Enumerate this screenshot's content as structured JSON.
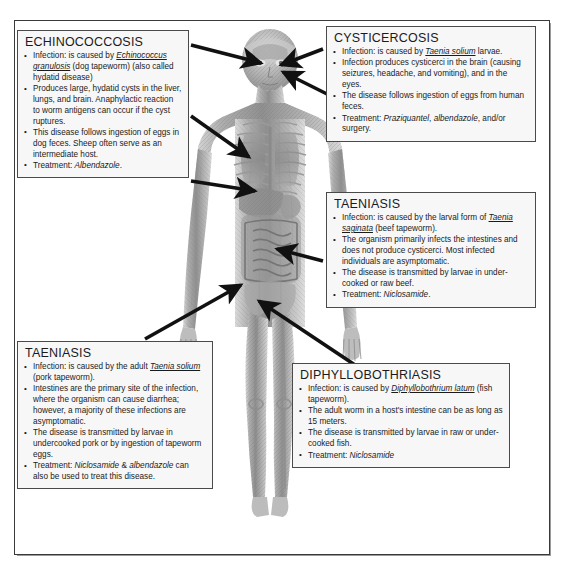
{
  "figure": {
    "colors": {
      "frame_border": "#3a3a3a",
      "box_border": "#4a4a4a",
      "box_fill": "#f7f7f7",
      "arrow": "#111111",
      "text": "#1b1b1b",
      "page_background": "#ffffff"
    }
  },
  "callouts": [
    {
      "id": "echinococcosis",
      "title": "ECHINOCOCCOSIS",
      "bullets": [
        "Infection: is caused by <u><i>Echinococcus granulosis</i></u> (dog tapeworm) (also called hydatid disease)",
        "Produces large, hydatid cysts in the liver, lungs, and brain. Anaphylactic reaction to worm antigens can occur if the cyst ruptures.",
        "This disease follows ingestion of eggs in dog feces. Sheep often serve as an intermediate host.",
        "Treatment: <i>Albendazole</i>."
      ]
    },
    {
      "id": "cysticercosis",
      "title": "CYSTICERCOSIS",
      "bullets": [
        "Infection: is caused by <u><i>Taenia solium</i></u> larvae.",
        "Infection produces cysticerci in the brain (causing seizures, headache, and vomiting), and in the eyes.",
        "The disease follows ingestion of eggs from human feces.",
        "Treatment: <i>Praziquantel</i>, <i>albendazole</i>, and/or surgery."
      ]
    },
    {
      "id": "taeniasis-right",
      "title": "TAENIASIS",
      "bullets": [
        "Infection: is caused by the larval form of <u><i>Taenia saginata</i></u> (beef tapeworm).",
        "The organism primarily infects the intestines and does not produce cysticerci. Most infected individuals are asymptomatic.",
        "The disease is transmitted by larvae in under-cooked or raw beef.",
        "Treatment: <i>Niclosamide</i>."
      ]
    },
    {
      "id": "taeniasis-left",
      "title": "TAENIASIS",
      "bullets": [
        "Infection: is caused by the adult <u><i>Taenia solium</i></u> (pork tapeworm).",
        "Intestines are the primary site of the infection, where the organism can cause diarrhea; however, a majority of these infections are asymptomatic.",
        "The disease is transmitted by larvae in undercooked pork or by ingestion of tapeworm eggs.",
        "Treatment: <i>Niclosamide</i> &amp; <i>albendazole</i> can also be used to treat this disease."
      ]
    },
    {
      "id": "diphyllobothriasis",
      "title": "DIPHYLLOBOTHRIASIS",
      "bullets": [
        "Infection: is caused by <u><i>Diphyllobothrium latum</i></u> (fish tapeworm).",
        "The adult worm in a host's intestine can be as long as 15 meters.",
        "The disease is transmitted by larvae in raw or under-cooked fish.",
        "Treatment: <i>Niclosamide</i>"
      ]
    }
  ],
  "arrows": [
    {
      "name": "echinococcosis-to-brain",
      "from_box": "echinococcosis",
      "target": "brain"
    },
    {
      "name": "echinococcosis-to-lungs",
      "from_box": "echinococcosis",
      "target": "lungs"
    },
    {
      "name": "echinococcosis-to-liver",
      "from_box": "echinococcosis",
      "target": "liver"
    },
    {
      "name": "cysticercosis-to-brain",
      "from_box": "cysticercosis",
      "target": "brain"
    },
    {
      "name": "cysticercosis-to-eyes",
      "from_box": "cysticercosis",
      "target": "eyes"
    },
    {
      "name": "taeniasis-right-to-intestines",
      "from_box": "taeniasis-right",
      "target": "intestines"
    },
    {
      "name": "taeniasis-left-to-intestines",
      "from_box": "taeniasis-left",
      "target": "intestines"
    },
    {
      "name": "diphyllobothriasis-to-intestines",
      "from_box": "diphyllobothriasis",
      "target": "intestines"
    }
  ]
}
